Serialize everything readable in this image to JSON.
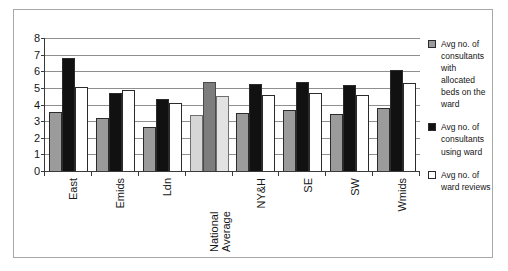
{
  "chart_data": {
    "type": "bar",
    "title": "",
    "xlabel": "",
    "ylabel": "",
    "ylim": [
      0,
      8
    ],
    "yticks": [
      0,
      1,
      2,
      3,
      4,
      5,
      6,
      7,
      8
    ],
    "grid": true,
    "legend_position": "right",
    "categories": [
      "East",
      "Emids",
      "Ldn",
      "National Average",
      "NY&H",
      "SE",
      "SW",
      "Wmids"
    ],
    "series": [
      {
        "name": "Avg no. of consultants with allocated beds on the ward",
        "color": "#9b9b9b",
        "values": [
          3.55,
          3.2,
          2.65,
          3.35,
          3.5,
          3.65,
          3.45,
          3.8
        ]
      },
      {
        "name": "Avg no. of consultants using ward",
        "color": "#111111",
        "values": [
          6.8,
          4.7,
          4.35,
          5.35,
          5.25,
          5.35,
          5.15,
          6.1
        ]
      },
      {
        "name": "Avg no. of ward reviews",
        "color": "#ffffff",
        "values": [
          5.05,
          4.85,
          4.1,
          4.5,
          4.6,
          4.7,
          4.6,
          5.3
        ]
      }
    ],
    "highlight_category": "National Average"
  },
  "legend": {
    "items": [
      {
        "label": "Avg no. of consultants with allocated beds on the ward",
        "swatch": "gray-swatch"
      },
      {
        "label": "Avg no. of consultants using ward",
        "swatch": "black-swatch"
      },
      {
        "label": "Avg no. of ward reviews",
        "swatch": "white-swatch"
      }
    ]
  }
}
